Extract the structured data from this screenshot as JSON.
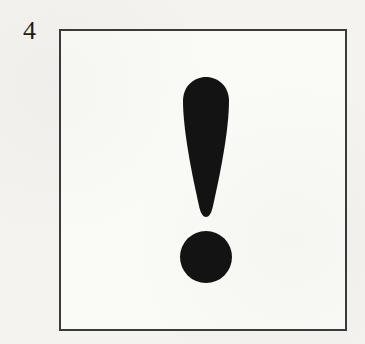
{
  "item": {
    "number": "4"
  },
  "figure": {
    "symbol": "exclamation-mark",
    "ink_color": "#131313",
    "border_color": "#3b3b3b",
    "paper_color": "#f4f3f0",
    "box_fill": "#fafaf7"
  }
}
